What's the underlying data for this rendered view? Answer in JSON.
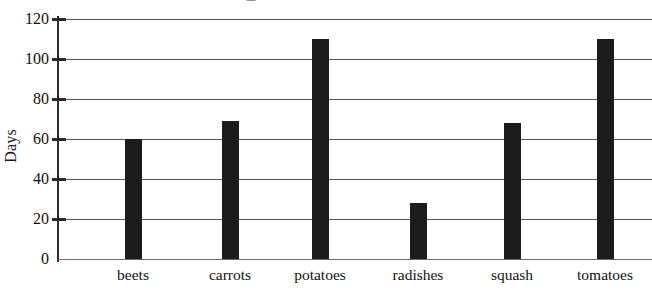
{
  "chart": {
    "type": "bar",
    "ylabel": "Days",
    "title": "",
    "xlabel": ""
  },
  "chart_data": {
    "type": "bar",
    "title": "",
    "xlabel": "",
    "ylabel": "Days",
    "categories": [
      "beets",
      "carrots",
      "potatoes",
      "radishes",
      "squash",
      "tomatoes"
    ],
    "values": [
      60,
      69,
      110,
      28,
      68,
      110
    ],
    "ylim": [
      0,
      120
    ],
    "ytick_labels": [
      "0",
      "20",
      "40",
      "60",
      "80",
      "100",
      "120"
    ],
    "yticks": [
      0,
      20,
      40,
      60,
      80,
      100,
      120
    ],
    "grid": "horizontal",
    "legend": "none",
    "bar_color": "#1c1c1c",
    "grid_color": "#555555",
    "axis_color": "#2b2b2b",
    "background": "#ffffff"
  }
}
